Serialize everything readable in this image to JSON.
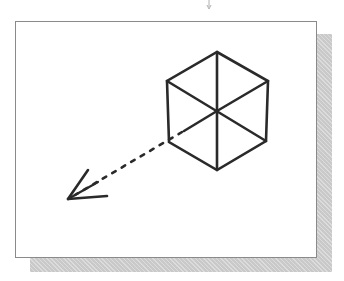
{
  "figure": {
    "frame": {
      "x": 15,
      "y": 21,
      "width": 302,
      "height": 237,
      "border_color": "#8a8a8a",
      "background": "#ffffff"
    },
    "shadow": {
      "x": 30,
      "y": 34,
      "width": 302,
      "height": 238,
      "color": "#c9c9c9"
    },
    "line_color": "#2a2a2a",
    "cube": {
      "vertices": {
        "top": [
          217,
          52
        ],
        "upper_left": [
          167,
          81
        ],
        "upper_right": [
          268,
          81
        ],
        "lower_left": [
          169,
          142
        ],
        "lower_right": [
          266,
          141
        ],
        "bottom": [
          217,
          170
        ],
        "center": [
          217,
          111
        ]
      }
    },
    "view_arrow": {
      "style": "dashed",
      "from": [
        217,
        111
      ],
      "tip": [
        68,
        199
      ],
      "barb_a": [
        88,
        170
      ],
      "barb_b": [
        107,
        196
      ]
    },
    "pointer_mark": {
      "x": 209,
      "y": 3
    }
  }
}
